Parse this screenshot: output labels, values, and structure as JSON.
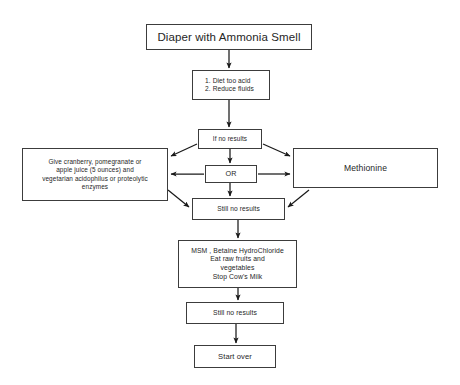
{
  "diagram": {
    "title": "Diaper with Ammonia Smell",
    "type": "flowchart",
    "orientation": "top-to-bottom",
    "colors": {
      "background": "#ffffff",
      "border": "#3c3c3c",
      "text": "#262626",
      "connector": "#1a1a1a"
    },
    "nodes": [
      {
        "id": "title",
        "label": "Diaper with Ammonia Smell",
        "lines": [
          "Diaper with Ammonia Smell"
        ]
      },
      {
        "id": "steps",
        "label": "1. Diet too acid 2. Reduce fluids",
        "lines": [
          "1. Diet too acid",
          "2. Reduce fluids"
        ]
      },
      {
        "id": "ifno",
        "label": "If no results",
        "lines": [
          "If no results"
        ]
      },
      {
        "id": "left",
        "label": "Give cranberry, pomegranate or apple juice (5 ounces) and vegetarian acidophilus or proteolytic enzymes",
        "lines": [
          "Give cranberry, pomegranate or",
          "apple juice (5 ounces) and",
          "vegetarian acidophilus or proteolytic",
          "enzymes"
        ]
      },
      {
        "id": "or",
        "label": "OR",
        "lines": [
          "OR"
        ]
      },
      {
        "id": "right",
        "label": "Methionine",
        "lines": [
          "Methionine"
        ]
      },
      {
        "id": "still1",
        "label": "Still no results",
        "lines": [
          "Still no results"
        ]
      },
      {
        "id": "msm",
        "label": "MSM, Betaine HydroChloride Eat raw fruits and vegetables Stop Cow's Milk",
        "lines": [
          "MSM , Betaine HydroChloride",
          "Eat raw fruits and",
          "vegetables",
          "Stop Cow's Milk"
        ]
      },
      {
        "id": "still2",
        "label": "Still no results",
        "lines": [
          "Still no results"
        ]
      },
      {
        "id": "start",
        "label": "Start over",
        "lines": [
          "Start over"
        ]
      }
    ],
    "edges": [
      {
        "from": "title",
        "to": "steps",
        "style": "vertical-arrow"
      },
      {
        "from": "steps",
        "to": "ifno",
        "style": "vertical-arrow"
      },
      {
        "from": "ifno",
        "to": "left",
        "style": "diagonal-arrow"
      },
      {
        "from": "ifno",
        "to": "right",
        "style": "diagonal-arrow"
      },
      {
        "from": "ifno",
        "to": "or",
        "style": "vertical-arrow"
      },
      {
        "from": "or",
        "to": "left",
        "style": "horizontal-arrow"
      },
      {
        "from": "or",
        "to": "right",
        "style": "horizontal-arrow"
      },
      {
        "from": "or",
        "to": "still1",
        "style": "vertical-arrow"
      },
      {
        "from": "left",
        "to": "still1",
        "style": "diagonal-arrow"
      },
      {
        "from": "right",
        "to": "still1",
        "style": "diagonal-arrow"
      },
      {
        "from": "still1",
        "to": "msm",
        "style": "vertical-arrow"
      },
      {
        "from": "msm",
        "to": "still2",
        "style": "vertical-arrow"
      },
      {
        "from": "still2",
        "to": "start",
        "style": "vertical-arrow"
      }
    ]
  }
}
